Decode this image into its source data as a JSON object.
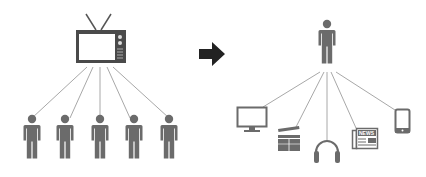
{
  "diagram": {
    "left": {
      "source": "television",
      "audience_count": 5,
      "audience": [
        "person",
        "person",
        "person",
        "person",
        "person"
      ]
    },
    "arrow": "right-arrow",
    "right": {
      "source": "person",
      "channels": [
        "computer-monitor",
        "clapperboard",
        "headphones",
        "newspaper",
        "mobile-phone"
      ],
      "newspaper_label": "NEWS"
    },
    "colors": {
      "figure": "#6b6b6b",
      "line": "#a8a8a8",
      "arrow": "#222222",
      "tv": "#4a4a4a"
    }
  }
}
